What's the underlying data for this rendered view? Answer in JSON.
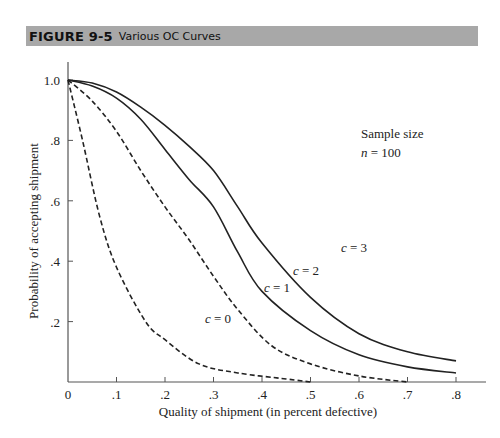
{
  "figure": {
    "number": "FIGURE 9-5",
    "title": "Various OC Curves"
  },
  "chart_data": {
    "type": "line",
    "title": "Various OC Curves",
    "xlabel": "Quality of shipment (in percent defective)",
    "ylabel": "Probability of accepting shipment",
    "xlim": [
      0,
      0.85
    ],
    "ylim": [
      0,
      1.0
    ],
    "x_ticks": [
      "0",
      ".1",
      ".2",
      ".3",
      ".4",
      ".5",
      ".6",
      ".7",
      ".8"
    ],
    "y_ticks": [
      "1.0",
      ".8",
      ".6",
      ".4",
      ".2"
    ],
    "grid": false,
    "annotation": {
      "line1": "Sample size",
      "line2_var": "n",
      "line2_rest": " = 100"
    },
    "series": [
      {
        "name": "c = 0",
        "var": "c",
        "value_label": " = 0",
        "style": "dashed",
        "x": [
          0,
          0.03,
          0.065,
          0.1,
          0.16,
          0.2,
          0.27,
          0.35,
          0.45,
          0.5
        ],
        "y": [
          1.0,
          0.8,
          0.55,
          0.38,
          0.2,
          0.14,
          0.06,
          0.03,
          0.01,
          0.0
        ]
      },
      {
        "name": "c = 1",
        "var": "c",
        "value_label": " = 1",
        "style": "dashed",
        "x": [
          0,
          0.05,
          0.1,
          0.15,
          0.2,
          0.25,
          0.3,
          0.35,
          0.42,
          0.5,
          0.6,
          0.7
        ],
        "y": [
          1.0,
          0.93,
          0.83,
          0.7,
          0.58,
          0.47,
          0.35,
          0.24,
          0.12,
          0.06,
          0.02,
          0.0
        ]
      },
      {
        "name": "c = 2",
        "var": "c",
        "value_label": " = 2",
        "style": "solid",
        "x": [
          0,
          0.05,
          0.1,
          0.15,
          0.2,
          0.25,
          0.3,
          0.35,
          0.4,
          0.5,
          0.6,
          0.7,
          0.8
        ],
        "y": [
          1.0,
          0.98,
          0.94,
          0.87,
          0.77,
          0.67,
          0.58,
          0.43,
          0.3,
          0.17,
          0.09,
          0.05,
          0.03
        ]
      },
      {
        "name": "c = 3",
        "var": "c",
        "value_label": " = 3",
        "style": "solid",
        "x": [
          0,
          0.05,
          0.1,
          0.15,
          0.2,
          0.25,
          0.3,
          0.35,
          0.4,
          0.5,
          0.6,
          0.7,
          0.8
        ],
        "y": [
          1.0,
          0.99,
          0.96,
          0.91,
          0.85,
          0.78,
          0.7,
          0.58,
          0.46,
          0.28,
          0.16,
          0.1,
          0.07
        ]
      }
    ],
    "series_label_positions": [
      {
        "x": 205,
        "y": 323
      },
      {
        "x": 264,
        "y": 292
      },
      {
        "x": 293,
        "y": 275
      },
      {
        "x": 341,
        "y": 252
      }
    ]
  },
  "colors": {
    "header_bg": "#a8a8a8",
    "ink": "#222222"
  }
}
